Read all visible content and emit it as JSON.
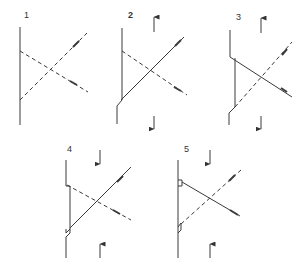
{
  "figure": {
    "line_color": "#3a3a3a",
    "dash_color": "#555555",
    "panels": [
      {
        "label": "1",
        "label_pos": [
          24,
          11
        ]
      },
      {
        "label": "2",
        "label_pos": [
          128,
          11
        ]
      },
      {
        "label": "3",
        "label_pos": [
          236,
          13
        ]
      },
      {
        "label": "4",
        "label_pos": [
          67,
          145
        ]
      },
      {
        "label": "5",
        "label_pos": [
          184,
          145
        ]
      }
    ]
  }
}
